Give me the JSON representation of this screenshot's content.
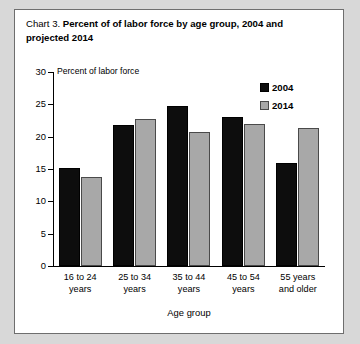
{
  "card": {
    "title_number": "Chart 3.",
    "title_main": "Percent of of labor force by age group, 2004 and projected 2014"
  },
  "legend": {
    "position": "top-right",
    "items": [
      {
        "label": "2004",
        "color": "#0d0d0d"
      },
      {
        "label": "2014",
        "color": "#a8a8a8"
      }
    ]
  },
  "chart_data": {
    "type": "bar",
    "title": "Chart 3. Percent of of labor force by age group, 2004 and projected 2014",
    "xlabel": "Age group",
    "ylabel": "Percent of labor force",
    "ylim": [
      0,
      30
    ],
    "yticks": [
      0,
      5,
      10,
      15,
      20,
      25,
      30
    ],
    "ytick_labels": [
      "0",
      "5",
      "10",
      "15",
      "20",
      "25",
      "30"
    ],
    "grid": false,
    "legend_position": "upper right",
    "categories": [
      "16 to 24 years",
      "25 to 34 years",
      "35 to 44 years",
      "45 to 54 years",
      "55 years and older"
    ],
    "category_lines": [
      [
        "16 to 24",
        "years"
      ],
      [
        "25 to 34",
        "years"
      ],
      [
        "35 to 44",
        "years"
      ],
      [
        "45 to 54",
        "years"
      ],
      [
        "55 years",
        "and older"
      ]
    ],
    "series": [
      {
        "name": "2004",
        "color": "#0d0d0d",
        "values": [
          15.2,
          21.8,
          24.7,
          23.1,
          16.0
        ]
      },
      {
        "name": "2014",
        "color": "#a8a8a8",
        "values": [
          13.7,
          22.7,
          20.8,
          22.0,
          21.4
        ]
      }
    ]
  }
}
